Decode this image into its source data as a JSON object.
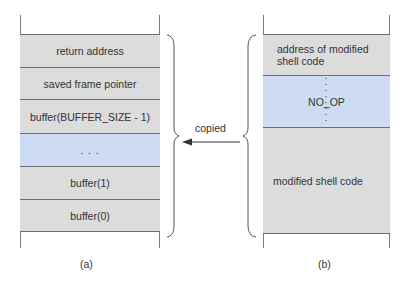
{
  "figure": {
    "a": {
      "caption": "(a)",
      "cells": [
        {
          "label": "return address",
          "fill": "#dcdcdc"
        },
        {
          "label": "saved frame pointer",
          "fill": "#dcdcdc"
        },
        {
          "label": "buffer(BUFFER_SIZE - 1)",
          "fill": "#dcdcdc"
        },
        {
          "label": ". . .",
          "fill": "#cddcf2"
        },
        {
          "label": "buffer(1)",
          "fill": "#dcdcdc"
        },
        {
          "label": "buffer(0)",
          "fill": "#dcdcdc"
        }
      ]
    },
    "b": {
      "caption": "(b)",
      "cells": [
        {
          "label": "address of modified shell code",
          "fill": "#dcdcdc"
        },
        {
          "label": "NO_OP",
          "fill": "#cddcf2"
        },
        {
          "label": "modified shell code",
          "fill": "#dcdcdc"
        }
      ]
    },
    "arrow_label": "copied"
  }
}
